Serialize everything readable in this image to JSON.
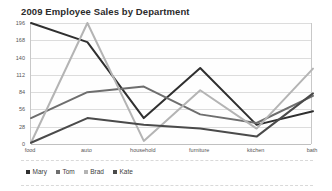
{
  "chart_data": {
    "type": "line",
    "title": "2009 Employee Sales by Department",
    "xlabel": "",
    "ylabel": "",
    "categories": [
      "food",
      "auto",
      "household",
      "furniture",
      "kitchen",
      "bath"
    ],
    "series": [
      {
        "name": "Mary",
        "color": "#2f2f2f",
        "values": [
          196,
          165,
          42,
          123,
          31,
          53
        ]
      },
      {
        "name": "Tom",
        "color": "#6e6e6e",
        "values": [
          42,
          84,
          93,
          48,
          34,
          78
        ]
      },
      {
        "name": "Brad",
        "color": "#b4b4b4",
        "values": [
          2,
          196,
          5,
          87,
          25,
          122
        ]
      },
      {
        "name": "Kate",
        "color": "#4a4a4a",
        "values": [
          2,
          42,
          31,
          25,
          12,
          82
        ]
      }
    ],
    "yticks": [
      "0",
      "28",
      "56",
      "84",
      "112",
      "140",
      "168",
      "196"
    ],
    "ylim": [
      0,
      196
    ],
    "grid": true,
    "legend_position": "bottom-left",
    "legend_entries": [
      "Mary",
      "Tom",
      "Brad",
      "Kate"
    ]
  },
  "legend": {
    "items": [
      {
        "label": "Mary",
        "color": "#2f2f2f"
      },
      {
        "label": "Tom",
        "color": "#6e6e6e"
      },
      {
        "label": "Brad",
        "color": "#b4b4b4"
      },
      {
        "label": "Kate",
        "color": "#4a4a4a"
      }
    ]
  }
}
